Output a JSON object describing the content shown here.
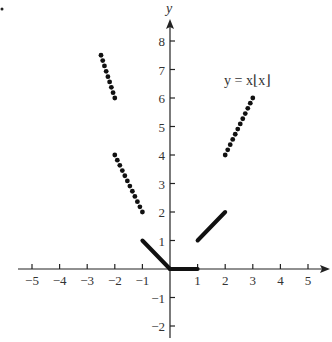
{
  "chart_data": {
    "type": "scatter",
    "title": "",
    "annotation": "y = x⌊x⌋",
    "xlabel": "",
    "ylabel": "y",
    "xlim": [
      -5.5,
      5.8
    ],
    "ylim": [
      -2.4,
      8.8
    ],
    "grid": false,
    "legend": "none",
    "x_ticks": [
      -5,
      -4,
      -3,
      -2,
      -1,
      1,
      2,
      3,
      4,
      5
    ],
    "x_tick_labels": [
      "−5",
      "−4",
      "−3",
      "−2",
      "−1",
      "1",
      "2",
      "3",
      "4",
      "5"
    ],
    "y_ticks": [
      8,
      7,
      6,
      5,
      4,
      3,
      2,
      1,
      -1,
      -2
    ],
    "y_tick_labels": [
      "8",
      "7",
      "6",
      "5",
      "4",
      "3",
      "2",
      "1",
      "−1",
      "−2"
    ],
    "series": [
      {
        "name": "x in [-2.5,-2): y = -3x (dotted)",
        "style": "dotted",
        "x": [
          -2.5,
          -2.0
        ],
        "y": [
          7.5,
          6.0
        ]
      },
      {
        "name": "x in [-2,-1): y = -2x (dotted)",
        "style": "dotted",
        "x": [
          -2.0,
          -1.0
        ],
        "y": [
          4.0,
          2.0
        ]
      },
      {
        "name": "x in [-1,0): y = -x",
        "style": "solid",
        "x": [
          -1,
          0
        ],
        "y": [
          1,
          0
        ]
      },
      {
        "name": "x in [0,1): y = 0",
        "style": "solid",
        "x": [
          0,
          1
        ],
        "y": [
          0,
          0
        ]
      },
      {
        "name": "x in [1,2): y = x",
        "style": "solid",
        "x": [
          1,
          2
        ],
        "y": [
          1,
          2
        ]
      },
      {
        "name": "x in [2,3): y = 2x (dotted)",
        "style": "dotted",
        "x": [
          2,
          3
        ],
        "y": [
          4,
          6
        ]
      }
    ]
  },
  "labels": {
    "y_axis": "y",
    "equation": "y = x⌊x⌋"
  }
}
